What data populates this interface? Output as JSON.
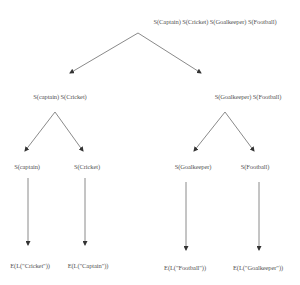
{
  "diagram": {
    "type": "tree",
    "root": {
      "label": "S(Captain)  S(Cricket)  S(Goalkeeper)  S(Football)"
    },
    "level2": [
      {
        "label": "S(captain)  S(Cricket)"
      },
      {
        "label": "S(Goalkeeper)  S(Football)"
      }
    ],
    "level3": [
      {
        "label": "S(captain)"
      },
      {
        "label": "S(Cricket)"
      },
      {
        "label": "S(Goalkeeper)"
      },
      {
        "label": "S(Football)"
      }
    ],
    "leaves": [
      {
        "label": "E(L(\"Cricket\"))"
      },
      {
        "label": "E(L(\"Captain\"))"
      },
      {
        "label": "E(L(\"Football\"))"
      },
      {
        "label": "E(L(\"Goalkeeper\"))"
      }
    ],
    "colors": {
      "edge": "#7a7a7a",
      "text": "#555555",
      "background": "#ffffff"
    }
  }
}
